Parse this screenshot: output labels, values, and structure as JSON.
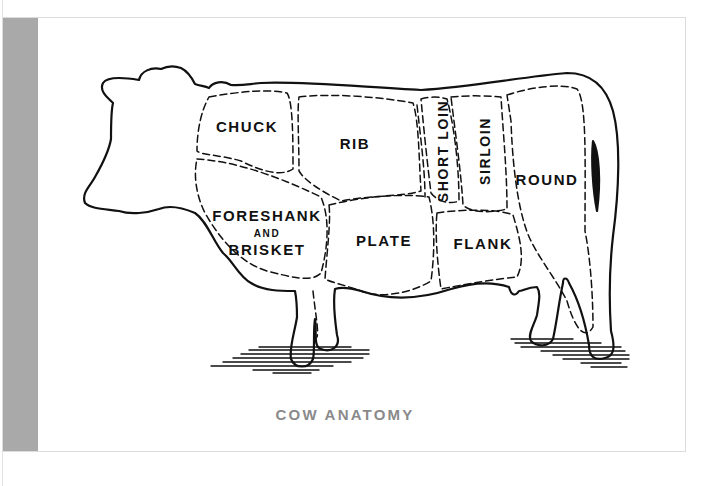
{
  "figure": {
    "caption": "COW ANATOMY",
    "caption_color": "#8a8a8a",
    "strip_color": "#a9a9a9",
    "outline_color": "#111111"
  },
  "cuts": {
    "chuck": "CHUCK",
    "rib": "RIB",
    "short_loin": "SHORT LOIN",
    "sirloin": "SIRLOIN",
    "round": "ROUND",
    "foreshank_line1": "FORESHANK",
    "foreshank_line2": "AND",
    "foreshank_line3": "BRISKET",
    "plate": "PLATE",
    "flank": "FLANK"
  }
}
